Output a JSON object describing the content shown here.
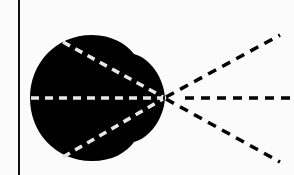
{
  "diagram": {
    "type": "optics-ray-diagram",
    "colors": {
      "background": "#fbfbfb",
      "blob": "#000000",
      "inner_rays": "#e8e8e8",
      "outer_rays": "#000000",
      "boundary_line": "#111111"
    },
    "boundary_line": {
      "x": 19,
      "y1": 0,
      "y2": 175
    },
    "focal_point": {
      "x": 165,
      "y": 98
    },
    "rays": [
      {
        "name": "upper",
        "inner_start": [
          63,
          42
        ],
        "outer_end": [
          280,
          35
        ]
      },
      {
        "name": "middle",
        "inner_start": [
          31,
          98
        ],
        "outer_end": [
          292,
          98
        ]
      },
      {
        "name": "lower",
        "inner_start": [
          63,
          157
        ],
        "outer_end": [
          280,
          162
        ]
      }
    ]
  }
}
